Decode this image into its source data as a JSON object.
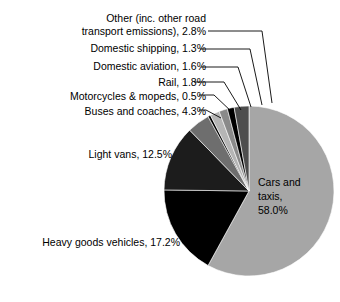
{
  "chart_data": {
    "type": "pie",
    "title": "",
    "subtitle": "",
    "xlabel": "",
    "ylabel": "",
    "legend_position": "none",
    "grid": false,
    "units": "percent",
    "categories": [
      "Cars and taxis",
      "Heavy goods vehicles",
      "Light vans",
      "Buses and coaches",
      "Motorcycles & mopeds",
      "Rail",
      "Domestic aviation",
      "Domestic shipping",
      "Other (inc. other road transport emissions)"
    ],
    "values": [
      58.0,
      17.2,
      12.5,
      4.3,
      0.5,
      1.8,
      1.6,
      1.3,
      2.8
    ],
    "slices": [
      {
        "label": "Cars and taxis",
        "value": 58.0,
        "display": "Cars and taxis, 58.0%",
        "color": "#a6a6a6",
        "placement": "inside"
      },
      {
        "label": "Heavy goods vehicles",
        "value": 17.2,
        "display": "Heavy goods vehicles, 17.2%",
        "color": "#000000",
        "placement": "outside-left"
      },
      {
        "label": "Light vans",
        "value": 12.5,
        "display": "Light vans, 12.5%",
        "color": "#1c1c1c",
        "placement": "outside-left"
      },
      {
        "label": "Buses and coaches",
        "value": 4.3,
        "display": "Buses and coaches, 4.3%",
        "color": "#6e6e6e",
        "placement": "callout"
      },
      {
        "label": "Motorcycles & mopeds",
        "value": 0.5,
        "display": "Motorcycles & mopeds, 0.5%",
        "color": "#000000",
        "placement": "callout"
      },
      {
        "label": "Rail",
        "value": 1.8,
        "display": "Rail, 1.8%",
        "color": "#b5b5b5",
        "placement": "callout"
      },
      {
        "label": "Domestic aviation",
        "value": 1.6,
        "display": "Domestic aviation, 1.6%",
        "color": "#8a8a8a",
        "placement": "callout"
      },
      {
        "label": "Domestic shipping",
        "value": 1.3,
        "display": "Domestic shipping, 1.3%",
        "color": "#000000",
        "placement": "callout"
      },
      {
        "label": "Other (inc. other road transport emissions)",
        "value": 2.8,
        "display": "Other (inc. other road transport emissions), 2.8%",
        "color": "#4d4d4d",
        "placement": "callout"
      }
    ]
  },
  "labels": {
    "other_line1": "Other (inc. other road",
    "other_line2": "transport emissions), 2.8%",
    "domestic_shipping": "Domestic shipping, 1.3%",
    "domestic_aviation": "Domestic aviation, 1.6%",
    "rail": "Rail, 1.8%",
    "motorcycles": "Motorcycles & mopeds, 0.5%",
    "buses": "Buses and coaches, 4.3%",
    "light_vans": "Light vans, 12.5%",
    "hgv": "Heavy goods vehicles, 17.2%",
    "cars_line1": "Cars and",
    "cars_line2": "taxis,",
    "cars_line3": "58.0%"
  },
  "colors": {
    "background": "#ffffff",
    "text": "#000000",
    "leader_line": "#000000",
    "cars_and_taxis": "#a6a6a6",
    "heavy_goods_vehicles": "#000000",
    "light_vans": "#1c1c1c",
    "buses_and_coaches": "#6e6e6e",
    "motorcycles_and_mopeds": "#000000",
    "rail": "#b5b5b5",
    "domestic_aviation": "#8a8a8a",
    "domestic_shipping": "#000000",
    "other": "#4d4d4d"
  }
}
